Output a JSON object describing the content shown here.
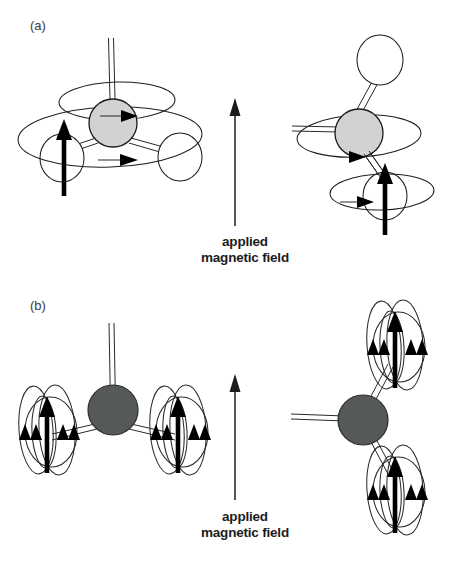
{
  "figure": {
    "background_color": "#ffffff",
    "width": 451,
    "height": 561
  },
  "panels": [
    {
      "id": "a",
      "label": "(a)",
      "label_x": 30,
      "label_y": 30,
      "description": "Molecular fragment with precessing nuclear spins shown as elliptical orbits",
      "field_label": {
        "line1": "applied",
        "line2": "magnetic field",
        "x": 245,
        "y1": 246,
        "y2": 262
      },
      "field_arrow": {
        "x": 235,
        "y_top": 100,
        "y_bottom": 226
      },
      "structures": [
        {
          "id": "a-left",
          "central_atom": {
            "cx": 113,
            "cy": 123,
            "r": 24,
            "fill": "#d2d2d2",
            "type": "carbon-light"
          },
          "hydrogens": [
            {
              "cx": 62,
              "cy": 158,
              "rx": 22,
              "ry": 24,
              "type": "hydrogen"
            },
            {
              "cx": 180,
              "cy": 157,
              "rx": 22,
              "ry": 24,
              "type": "hydrogen"
            }
          ],
          "orbits": [
            {
              "cx": 117,
              "cy": 100,
              "rx": 58,
              "ry": 19,
              "rot": -1
            },
            {
              "cx": 110,
              "cy": 135,
              "rx": 92,
              "ry": 30,
              "rot": -2
            }
          ],
          "spin_arrows": [
            {
              "x": 64,
              "y_top": 123,
              "y_bottom": 196,
              "thickness": 4.6
            }
          ],
          "orbit_arrowheads": [
            {
              "x": 128,
              "y": 116,
              "dir": "right"
            },
            {
              "x": 127,
              "y": 160,
              "dir": "right"
            }
          ],
          "bond_up": {
            "x1": 113,
            "y1": 123,
            "x2": 113,
            "y2": 40
          }
        },
        {
          "id": "a-right",
          "central_atom": {
            "cx": 359,
            "cy": 133,
            "r": 24,
            "fill": "#d2d2d2",
            "type": "carbon-light"
          },
          "hydrogens": [
            {
              "cx": 380,
              "cy": 60,
              "rx": 23,
              "ry": 25,
              "type": "hydrogen"
            },
            {
              "cx": 385,
              "cy": 196,
              "rx": 22,
              "ry": 24,
              "type": "hydrogen"
            }
          ],
          "orbits": [
            {
              "cx": 359,
              "cy": 136,
              "rx": 62,
              "ry": 21,
              "rot": -3
            },
            {
              "cx": 382,
              "cy": 192,
              "rx": 52,
              "ry": 18,
              "rot": -2
            }
          ],
          "spin_arrows": [
            {
              "x": 385,
              "y_top": 163,
              "y_bottom": 235,
              "thickness": 4.6
            }
          ],
          "orbit_arrowheads": [
            {
              "x": 360,
              "y": 161,
              "dir": "right"
            },
            {
              "x": 367,
              "y": 202,
              "dir": "right"
            }
          ],
          "bond_left": {
            "x1": 359,
            "y1": 133,
            "x2": 293,
            "y2": 129
          }
        }
      ]
    },
    {
      "id": "b",
      "label": "(b)",
      "label_x": 30,
      "label_y": 310,
      "description": "Molecular fragment with local magnetic field loops around nuclei",
      "field_label": {
        "line1": "applied",
        "line2": "magnetic field",
        "x": 245,
        "y1": 521,
        "y2": 537
      },
      "field_arrow": {
        "x": 235,
        "y_top": 375,
        "y_bottom": 500
      },
      "structures": [
        {
          "id": "b-left",
          "central_atom": {
            "cx": 113,
            "cy": 410,
            "r": 25,
            "fill": "#56595a",
            "type": "carbon-dark"
          },
          "loop_clusters": [
            {
              "cx": 47,
              "cy": 430,
              "loops": 4,
              "arrowheads": 4
            },
            {
              "cx": 178,
              "cy": 430,
              "loops": 4,
              "arrowheads": 4
            }
          ],
          "bond_up": {
            "x1": 113,
            "y1": 410,
            "x2": 113,
            "y2": 325
          },
          "bonds": [
            {
              "x1": 113,
              "y1": 410,
              "x2": 58,
              "y2": 432
            },
            {
              "x1": 113,
              "y1": 410,
              "x2": 168,
              "y2": 432
            }
          ]
        },
        {
          "id": "b-right",
          "central_atom": {
            "cx": 363,
            "cy": 420,
            "r": 25,
            "fill": "#56595a",
            "type": "carbon-dark"
          },
          "loop_clusters": [
            {
              "cx": 395,
              "cy": 345,
              "loops": 4,
              "arrowheads": 4
            },
            {
              "cx": 395,
              "cy": 480,
              "loops": 4,
              "arrowheads": 4
            }
          ],
          "bond_left": {
            "x1": 363,
            "y1": 420,
            "x2": 292,
            "y2": 420
          },
          "bonds": [
            {
              "x1": 363,
              "y1": 420,
              "x2": 385,
              "y2": 362
            },
            {
              "x1": 363,
              "y1": 420,
              "x2": 385,
              "y2": 470
            }
          ]
        }
      ]
    }
  ],
  "colors": {
    "carbon_light": "#d2d2d2",
    "carbon_dark": "#56595a",
    "hydrogen": "#ffffff",
    "stroke": "#1f1f1f",
    "arrow": "#000000",
    "text": "#1c1c1c",
    "panel_label": "#3b3b3b"
  }
}
